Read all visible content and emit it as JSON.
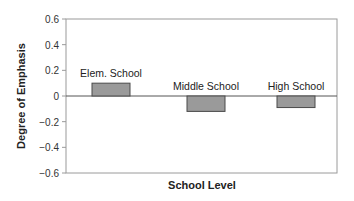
{
  "chart_data": {
    "type": "bar",
    "title": "",
    "xlabel": "School Level",
    "ylabel": "Degree of Emphasis",
    "categories": [
      "Elem. School",
      "Middle School",
      "High School"
    ],
    "values": [
      0.1,
      -0.12,
      -0.09
    ],
    "ylim": [
      -0.6,
      0.6
    ],
    "yticks": [
      "0.6",
      "0.4",
      "0.2",
      "0",
      "−0.2",
      "−0.4",
      "−0.6"
    ],
    "grid": false,
    "legend": null,
    "bar_color": "#9a9a9a",
    "bar_edge_color": "#4a4a4a",
    "data_labels_are_category_names": true
  }
}
